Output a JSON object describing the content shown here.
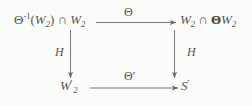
{
  "diagram": {
    "type": "commutative-square",
    "nodes": {
      "top_left": {
        "text": "Θ⁻¹(W₂) ∩ W₂",
        "base": "Θ",
        "exponent": "-1",
        "inner": "W",
        "inner_sub": "2",
        "operator": "∩",
        "second": "W",
        "second_sub": "2"
      },
      "top_right": {
        "text": "W₂ ∩ ΘW₂",
        "first": "W",
        "first_sub": "2",
        "operator": "∩",
        "theta": "Θ",
        "second": "W",
        "second_sub": "2"
      },
      "bottom_left": {
        "text": "W₂′",
        "letter": "W",
        "sub": "2",
        "prime": "′"
      },
      "bottom_right": {
        "text": "S′",
        "letter": "S",
        "prime": "′"
      }
    },
    "arrows": {
      "top": {
        "label": "Θ",
        "direction": "right",
        "from": "top_left",
        "to": "top_right"
      },
      "bottom": {
        "label": "Θ′",
        "direction": "right",
        "from": "bottom_left",
        "to": "bottom_right"
      },
      "left": {
        "label": "H",
        "direction": "down",
        "from": "top_left",
        "to": "bottom_left"
      },
      "right": {
        "label": "H",
        "direction": "down",
        "from": "top_right",
        "to": "bottom_right"
      }
    },
    "colors": {
      "background": "#fbfbfa",
      "ink": "#555452",
      "bold_ink": "#3c3b39"
    }
  }
}
